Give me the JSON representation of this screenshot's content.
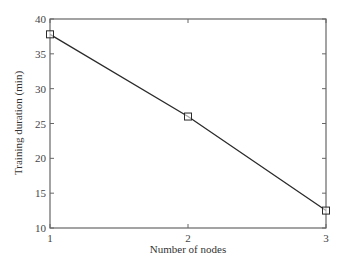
{
  "chart_data": {
    "type": "line",
    "title": "",
    "xlabel": "Number of nodes",
    "ylabel": "Training duration (min)",
    "x": [
      1,
      2,
      3
    ],
    "series": [
      {
        "name": "Training duration",
        "values": [
          37.8,
          26.0,
          12.5
        ],
        "marker": "square",
        "color": "#2a2a2a"
      }
    ],
    "xlim": [
      1,
      3
    ],
    "ylim": [
      10,
      40
    ],
    "xticks": [
      1,
      2,
      3
    ],
    "yticks": [
      10,
      15,
      20,
      25,
      30,
      35,
      40
    ],
    "grid": false,
    "legend": null
  },
  "colors": {
    "axis": "#666666",
    "line": "#2a2a2a"
  }
}
